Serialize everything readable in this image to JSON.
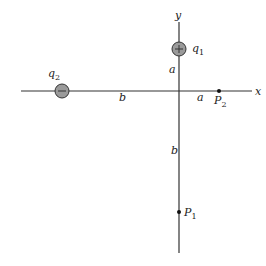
{
  "diagram": {
    "axes": {
      "x_label": "x",
      "y_label": "y"
    },
    "charges": [
      {
        "name": "q",
        "subscript": "1",
        "sign": "+",
        "position": "on y-axis, distance a above origin"
      },
      {
        "name": "q",
        "subscript": "2",
        "sign": "-",
        "position": "on x-axis, distance b left of origin"
      }
    ],
    "points": [
      {
        "name": "P",
        "subscript": "1",
        "position": "on y-axis, distance b below origin"
      },
      {
        "name": "P",
        "subscript": "2",
        "position": "on x-axis, distance a right of origin"
      }
    ],
    "distances": {
      "q1_to_origin": "a",
      "origin_to_p2": "a",
      "q2_to_origin": "b",
      "origin_to_p1": "b"
    },
    "colors": {
      "axis": "#333333",
      "charge_fill": "#9a9a9a",
      "charge_stroke": "#333333"
    }
  }
}
